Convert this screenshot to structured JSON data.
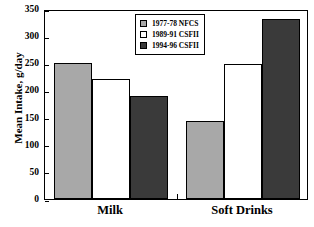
{
  "chart_data": {
    "type": "bar",
    "title": "",
    "xlabel": "",
    "ylabel": "Mean Intake, g/day",
    "categories": [
      "Milk",
      "Soft Drinks"
    ],
    "series": [
      {
        "name": "1977-78 NFCS",
        "values": [
          251,
          143
        ],
        "color": "#a8a8a8"
      },
      {
        "name": "1989-91 CSFII",
        "values": [
          221,
          249
        ],
        "color": "#ffffff"
      },
      {
        "name": "1994-96 CSFII",
        "values": [
          190,
          332
        ],
        "color": "#3a3a3a"
      }
    ],
    "ylim": [
      0,
      350
    ],
    "yticks": [
      0,
      50,
      100,
      150,
      200,
      250,
      300,
      350
    ],
    "ytick_labels": [
      "0",
      "50",
      "100",
      "150",
      "200",
      "250",
      "300",
      "350"
    ],
    "grid": false,
    "legend_position": "top-center"
  },
  "axis": {
    "y_title": "Mean Intake, g/day"
  },
  "legend": {
    "entries": [
      {
        "label": "1977-78 NFCS"
      },
      {
        "label": "1989-91 CSFII"
      },
      {
        "label": "1994-96 CSFII"
      }
    ]
  }
}
